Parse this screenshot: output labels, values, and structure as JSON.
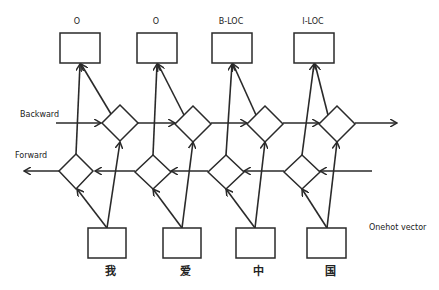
{
  "diagram": {
    "labels": {
      "backward": "Backward",
      "forward": "Forward",
      "input_note": "Onehot vector"
    },
    "columns": [
      {
        "output_tag": "O",
        "input_char": "我"
      },
      {
        "output_tag": "O",
        "input_char": "爱"
      },
      {
        "output_tag": "B-LOC",
        "input_char": "中"
      },
      {
        "output_tag": "I-LOC",
        "input_char": "国"
      }
    ],
    "colors": {
      "stroke": "#2a2a2a",
      "background": "#ffffff"
    }
  }
}
